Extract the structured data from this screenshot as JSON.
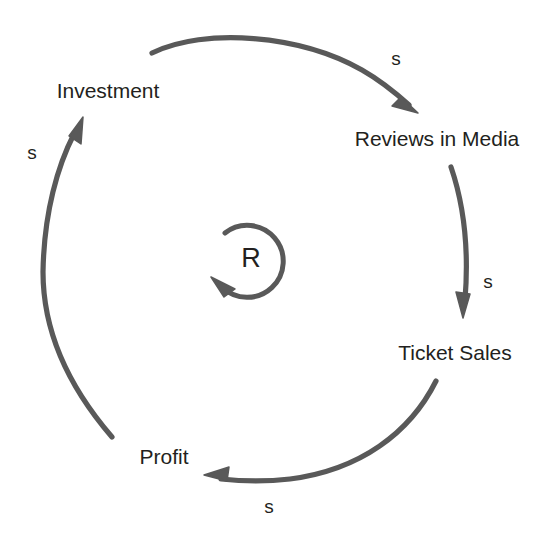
{
  "diagram": {
    "type": "causal-loop-diagram",
    "background_color": "#ffffff",
    "stroke_color": "#595959",
    "text_color": "#231f20",
    "loop": {
      "id": "R",
      "kind": "reinforcing",
      "center_x": 251,
      "center_y": 258,
      "radius": 36
    },
    "nodes": [
      {
        "key": "investment",
        "label": "Investment",
        "x": 108,
        "y": 90
      },
      {
        "key": "reviews_in_media",
        "label": "Reviews in Media",
        "x": 437,
        "y": 138
      },
      {
        "key": "ticket_sales",
        "label": "Ticket Sales",
        "x": 455,
        "y": 352
      },
      {
        "key": "profit",
        "label": "Profit",
        "x": 164,
        "y": 456
      }
    ],
    "links": [
      {
        "key": "investment-to-reviews",
        "from": "Investment",
        "to": "Reviews in Media",
        "polarity": "s",
        "label_x": 396,
        "label_y": 58
      },
      {
        "key": "reviews-to-ticket-sales",
        "from": "Reviews in Media",
        "to": "Ticket Sales",
        "polarity": "s",
        "label_x": 488,
        "label_y": 281
      },
      {
        "key": "ticket-sales-to-profit",
        "from": "Ticket Sales",
        "to": "Profit",
        "polarity": "s",
        "label_x": 269,
        "label_y": 506
      },
      {
        "key": "profit-to-investment",
        "from": "Profit",
        "to": "Investment",
        "polarity": "s",
        "label_x": 32,
        "label_y": 152
      }
    ]
  }
}
